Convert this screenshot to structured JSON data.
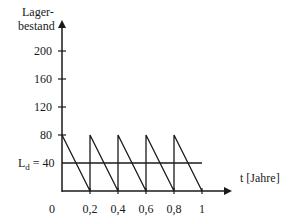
{
  "chart_data": {
    "type": "line",
    "title": "",
    "ylabel_line1": "Lager-",
    "ylabel_line2": "bestand",
    "xlabel": "t [Jahre]",
    "x_ticks": [
      {
        "value": 0,
        "label": "0"
      },
      {
        "value": 0.2,
        "label": "0,2"
      },
      {
        "value": 0.4,
        "label": "0,4"
      },
      {
        "value": 0.6,
        "label": "0,6"
      },
      {
        "value": 0.8,
        "label": "0,8"
      },
      {
        "value": 1,
        "label": "1"
      }
    ],
    "y_ticks": [
      {
        "value": 80,
        "label": "80"
      },
      {
        "value": 120,
        "label": "120"
      },
      {
        "value": 160,
        "label": "160"
      },
      {
        "value": 200,
        "label": "200"
      }
    ],
    "xlim": [
      0,
      1
    ],
    "ylim": [
      0,
      240
    ],
    "grid": false,
    "series": [
      {
        "name": "Lagerbestand",
        "x": [
          0,
          0.2,
          0.2,
          0.4,
          0.4,
          0.6,
          0.6,
          0.8,
          0.8,
          1.0
        ],
        "y": [
          80,
          0,
          80,
          0,
          80,
          0,
          80,
          0,
          80,
          0
        ]
      },
      {
        "name": "Durchschnittlicher Lagerbestand",
        "label": "L_d = 40",
        "x": [
          0,
          1
        ],
        "y": [
          40,
          40
        ]
      }
    ],
    "annotations": [
      {
        "text_main": "L",
        "text_sub": "d",
        "text_rest": " = 40",
        "y": 40
      }
    ]
  }
}
